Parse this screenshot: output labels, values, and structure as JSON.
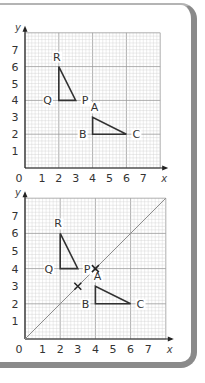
{
  "colors": {
    "grid_minor": "#d0d0d0",
    "grid_major": "#9a9a9a",
    "axis": "#222222",
    "shape": "#333333",
    "line": "#8c8c8c",
    "border": "#8a8a8a"
  },
  "chart_data": [
    {
      "type": "scatter",
      "title": "",
      "xlabel": "x",
      "ylabel": "y",
      "xlim": [
        0,
        8
      ],
      "ylim": [
        0,
        8
      ],
      "x_ticks": [
        "0",
        "1",
        "2",
        "3",
        "4",
        "5",
        "6",
        "7"
      ],
      "y_ticks": [
        "1",
        "2",
        "3",
        "4",
        "5",
        "6",
        "7"
      ],
      "grid": true,
      "shapes": [
        {
          "name": "PQR",
          "vertices": [
            {
              "label": "P",
              "x": 3,
              "y": 4
            },
            {
              "label": "Q",
              "x": 2,
              "y": 4
            },
            {
              "label": "R",
              "x": 2,
              "y": 6
            }
          ]
        },
        {
          "name": "ABC",
          "vertices": [
            {
              "label": "A",
              "x": 4,
              "y": 3
            },
            {
              "label": "B",
              "x": 4,
              "y": 2
            },
            {
              "label": "C",
              "x": 6,
              "y": 2
            }
          ]
        }
      ]
    },
    {
      "type": "scatter",
      "title": "",
      "xlabel": "x",
      "ylabel": "y",
      "xlim": [
        0,
        8
      ],
      "ylim": [
        0,
        8
      ],
      "x_ticks": [
        "0",
        "1",
        "2",
        "3",
        "4",
        "5",
        "6",
        "7"
      ],
      "y_ticks": [
        "1",
        "2",
        "3",
        "4",
        "5",
        "6",
        "7"
      ],
      "grid": true,
      "shapes": [
        {
          "name": "PQR",
          "vertices": [
            {
              "label": "P",
              "x": 3,
              "y": 4
            },
            {
              "label": "Q",
              "x": 2,
              "y": 4
            },
            {
              "label": "R",
              "x": 2,
              "y": 6
            }
          ]
        },
        {
          "name": "ABC",
          "vertices": [
            {
              "label": "A",
              "x": 4,
              "y": 3
            },
            {
              "label": "B",
              "x": 4,
              "y": 2
            },
            {
              "label": "C",
              "x": 6,
              "y": 2
            }
          ]
        }
      ],
      "line": {
        "equation": "y = x",
        "from": [
          0,
          0
        ],
        "to": [
          8,
          8
        ]
      },
      "marks": [
        {
          "symbol": "x",
          "x": 4,
          "y": 4
        },
        {
          "symbol": "x",
          "x": 3,
          "y": 3
        }
      ]
    }
  ]
}
